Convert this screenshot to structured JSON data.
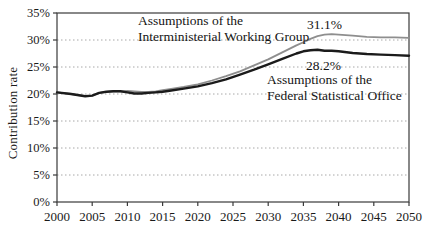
{
  "figure": {
    "y_axis_title": "Contribution rate",
    "annotations": {
      "imwg_line1": "Assumptions of the",
      "imwg_line2": "Interministerial Working Group",
      "imwg_peak_label": "31.1%",
      "fso_peak_label": "28.2%",
      "fso_line1": "Assumptions of the",
      "fso_line2": "Federal Statistical Office"
    },
    "colors": {
      "series_imwg": "#8e8e8e",
      "series_fso": "#1b1b1b",
      "gridline": "#a8a8a8",
      "axis": "#3a3a3a",
      "tick_text": "#1a1a1a",
      "background": "#ffffff"
    }
  },
  "chart_data": {
    "type": "line",
    "title": "",
    "xlabel": "",
    "ylabel": "Contribution rate",
    "xlim": [
      2000,
      2050
    ],
    "ylim": [
      0,
      35
    ],
    "x_ticks": [
      2000,
      2005,
      2010,
      2015,
      2020,
      2025,
      2030,
      2035,
      2040,
      2045,
      2050
    ],
    "y_ticks": [
      0,
      5,
      10,
      15,
      20,
      25,
      30,
      35
    ],
    "y_tick_suffix": "%",
    "grid": "horizontal-dotted",
    "legend_position": "none (in-chart text annotations)",
    "x": [
      2000,
      2002,
      2004,
      2005,
      2006,
      2007,
      2008,
      2009,
      2010,
      2011,
      2012,
      2013,
      2014,
      2015,
      2016,
      2018,
      2020,
      2022,
      2024,
      2026,
      2028,
      2030,
      2032,
      2034,
      2035,
      2036,
      2037,
      2038,
      2039,
      2040,
      2042,
      2044,
      2046,
      2048,
      2050
    ],
    "series": [
      {
        "name": "Assumptions of the Interministerial Working Group",
        "peak_label": "31.1%",
        "peak_year": 2039,
        "color_key": "series_imwg",
        "stroke_width": 1.8,
        "values": [
          20.3,
          20.0,
          19.6,
          19.7,
          20.2,
          20.4,
          20.5,
          20.5,
          20.6,
          20.5,
          20.4,
          20.4,
          20.5,
          20.7,
          20.9,
          21.3,
          21.8,
          22.5,
          23.3,
          24.2,
          25.3,
          26.4,
          27.7,
          29.0,
          29.6,
          30.2,
          30.7,
          31.0,
          31.1,
          31.0,
          30.8,
          30.6,
          30.5,
          30.5,
          30.4
        ]
      },
      {
        "name": "Assumptions of the Federal Statistical Office",
        "peak_label": "28.2%",
        "peak_year": 2037,
        "color_key": "series_fso",
        "stroke_width": 2.4,
        "values": [
          20.3,
          20.0,
          19.6,
          19.7,
          20.2,
          20.4,
          20.5,
          20.5,
          20.3,
          20.1,
          20.1,
          20.2,
          20.3,
          20.4,
          20.6,
          21.0,
          21.4,
          22.0,
          22.7,
          23.6,
          24.5,
          25.5,
          26.5,
          27.5,
          27.9,
          28.1,
          28.2,
          28.0,
          28.0,
          27.9,
          27.6,
          27.4,
          27.3,
          27.2,
          27.1
        ]
      }
    ]
  }
}
